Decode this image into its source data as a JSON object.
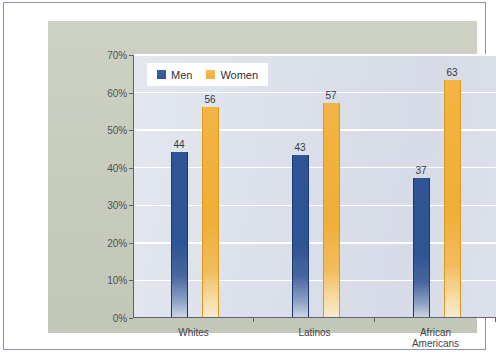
{
  "figure": {
    "frame_border_color": "#8d93ad",
    "panel_color": "#c9cec0",
    "plot_background_color": "#dfe3ec",
    "gridline_color": "#ffffff",
    "axis_color": "#5d6173"
  },
  "legend": {
    "position": "inside-top-left",
    "entries": [
      {
        "label": "Men",
        "swatch": "men-color-swatch",
        "color": "#2d5493"
      },
      {
        "label": "Women",
        "swatch": "women-color-swatch",
        "color": "#efae37"
      }
    ]
  },
  "chart_data": {
    "type": "bar",
    "title": "",
    "subtitle": "",
    "xlabel": "",
    "ylabel": "Percentage",
    "categories": [
      "Whites",
      "Latinos",
      "African Americans"
    ],
    "category_lines": [
      [
        "Whites"
      ],
      [
        "Latinos"
      ],
      [
        "African",
        "Americans"
      ]
    ],
    "series": [
      {
        "name": "Men",
        "color": "#2d5493",
        "values": [
          44,
          43,
          37
        ]
      },
      {
        "name": "Women",
        "color": "#efae37",
        "values": [
          56,
          57,
          63
        ]
      }
    ],
    "data_labels": [
      "44",
      "56",
      "43",
      "57",
      "37",
      "63"
    ],
    "ylim": [
      0,
      70
    ],
    "ytick_step": 10,
    "ytick_labels": [
      "0%",
      "10%",
      "20%",
      "30%",
      "40%",
      "50%",
      "60%",
      "70%"
    ],
    "ytick_values": [
      0,
      10,
      20,
      30,
      40,
      50,
      60,
      70
    ],
    "grid": "horizontal",
    "legend_position": "top-left"
  }
}
